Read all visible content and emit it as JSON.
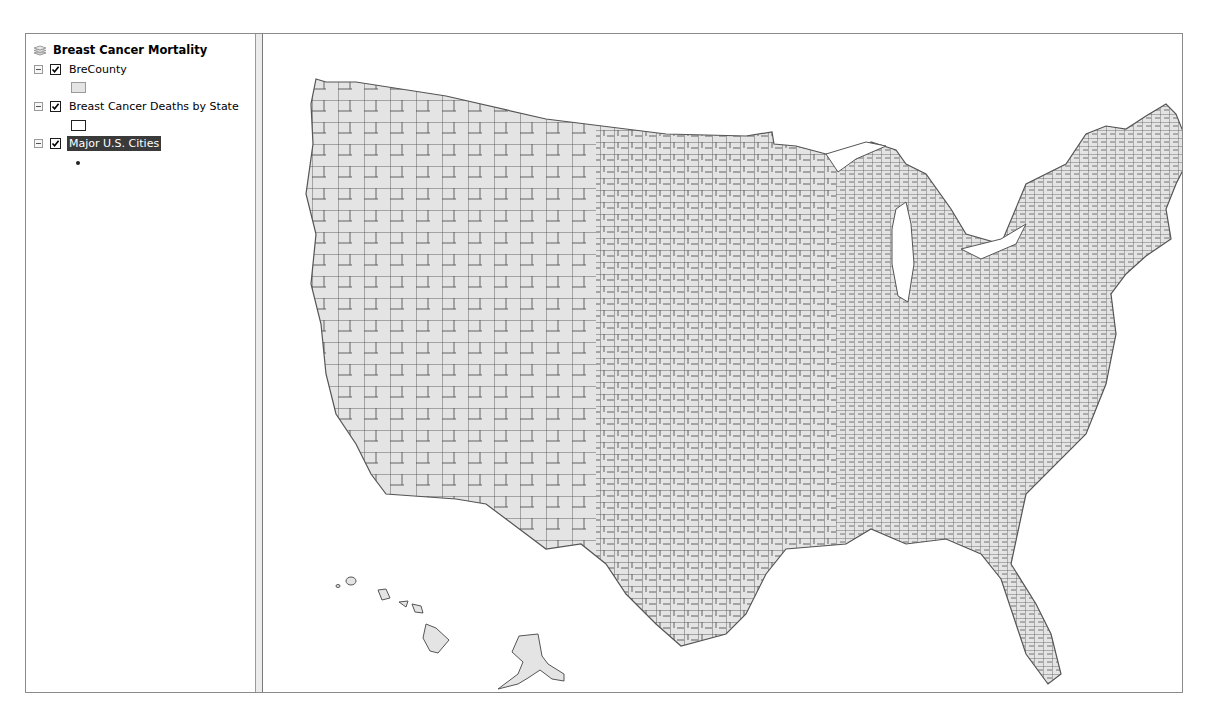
{
  "toc": {
    "root": {
      "title": "Breast Cancer Mortality",
      "icon": "layers-icon"
    },
    "layers": [
      {
        "name": "BreCounty",
        "checked": true,
        "expanded": true,
        "symbol": "polygon-fill",
        "symbol_color": "#e4e4e4",
        "selected": false
      },
      {
        "name": "Breast Cancer Deaths by State",
        "checked": true,
        "expanded": true,
        "symbol": "polygon-outline",
        "symbol_color": "#ffffff",
        "selected": false
      },
      {
        "name": "Major U.S. Cities",
        "checked": true,
        "expanded": true,
        "symbol": "point",
        "symbol_color": "#222222",
        "selected": true
      }
    ]
  },
  "map": {
    "content": "U.S. county boundaries choropleth (contiguous US with Alaska and Hawaii insets)",
    "fill_color": "#e4e4e4",
    "stroke_color": "#555555",
    "background": "#ffffff"
  },
  "colors": {
    "selection_bg": "#3a3a3a",
    "frame_border": "#8a8a8a"
  }
}
